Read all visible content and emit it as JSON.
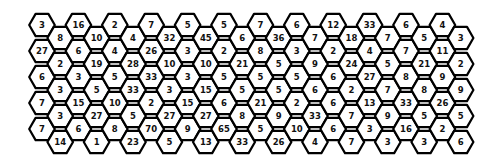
{
  "puzzle": {
    "type": "hex-number-grid",
    "columns": 24,
    "rows_per_column": 5,
    "colors": {
      "background": "#ffffff",
      "cell_fill": "#ffffff",
      "stroke": "#000000",
      "text": "#111111"
    },
    "grid": [
      [
        3,
        27,
        6,
        7,
        7
      ],
      [
        8,
        2,
        3,
        3,
        14
      ],
      [
        16,
        6,
        3,
        15,
        6
      ],
      [
        10,
        19,
        5,
        27,
        1
      ],
      [
        2,
        4,
        5,
        10,
        8
      ],
      [
        4,
        28,
        33,
        5,
        23
      ],
      [
        7,
        26,
        33,
        2,
        70
      ],
      [
        32,
        10,
        3,
        27,
        5
      ],
      [
        5,
        3,
        3,
        15,
        9
      ],
      [
        45,
        10,
        15,
        27,
        13
      ],
      [
        5,
        2,
        5,
        6,
        65
      ],
      [
        6,
        21,
        5,
        8,
        33
      ],
      [
        7,
        8,
        5,
        21,
        5
      ],
      [
        36,
        5,
        5,
        9,
        26
      ],
      [
        6,
        3,
        5,
        2,
        10
      ],
      [
        7,
        9,
        6,
        33,
        4
      ],
      [
        12,
        2,
        6,
        6,
        6
      ],
      [
        18,
        24,
        2,
        7,
        7
      ],
      [
        33,
        4,
        27,
        13,
        3
      ],
      [
        7,
        5,
        7,
        9,
        3
      ],
      [
        6,
        7,
        8,
        33,
        16
      ],
      [
        5,
        21,
        8,
        5,
        3
      ],
      [
        4,
        11,
        9,
        26,
        2
      ],
      [
        3,
        2,
        9,
        5,
        6
      ]
    ]
  }
}
